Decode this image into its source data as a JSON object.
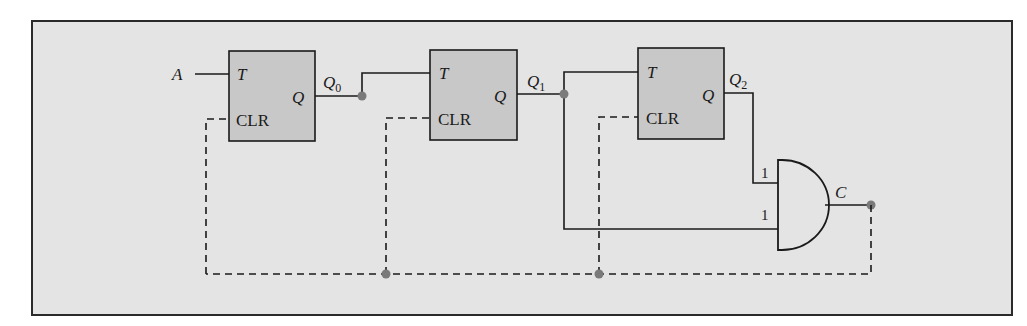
{
  "diagram": {
    "colors": {
      "frame_bg": "#e4e4e4",
      "frame_border": "#2a2a2a",
      "ff_fill": "#c8c8c8",
      "wire": "#1a1a1a",
      "node": "#7a7a7a"
    },
    "input_label": "A",
    "flip_flops": [
      {
        "t_label": "T",
        "q_label": "Q",
        "clr_label": "CLR",
        "output_name": "Q",
        "output_sub": "0"
      },
      {
        "t_label": "T",
        "q_label": "Q",
        "clr_label": "CLR",
        "output_name": "Q",
        "output_sub": "1"
      },
      {
        "t_label": "T",
        "q_label": "Q",
        "clr_label": "CLR",
        "output_name": "Q",
        "output_sub": "2"
      }
    ],
    "and_gate": {
      "input_labels": [
        "1",
        "1"
      ],
      "output_label": "C"
    }
  }
}
